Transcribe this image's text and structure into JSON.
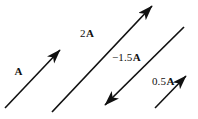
{
  "figure": {
    "background_color": "#ffffff",
    "stroke_color": "#111111",
    "width": 198,
    "height": 119
  },
  "vectors": [
    {
      "id": "a",
      "label_coefficient": "",
      "label_symbol": "A",
      "scalar": 1,
      "direction": "up-right",
      "x1": 5,
      "y1": 108,
      "x2": 60,
      "y2": 50,
      "stroke_width": 1.6,
      "head_size": 8
    },
    {
      "id": "2a",
      "label_coefficient": "2",
      "label_symbol": "A",
      "scalar": 2,
      "direction": "up-right",
      "x1": 52,
      "y1": 112,
      "x2": 152,
      "y2": 6,
      "stroke_width": 1.7,
      "head_size": 9
    },
    {
      "id": "neg15a",
      "label_coefficient": "−1.5",
      "label_symbol": "A",
      "scalar": -1.5,
      "direction": "down-left",
      "x1": 184,
      "y1": 27,
      "x2": 105,
      "y2": 105,
      "stroke_width": 1.7,
      "head_size": 9
    },
    {
      "id": "05a",
      "label_coefficient": "0.5",
      "label_symbol": "A",
      "scalar": 0.5,
      "direction": "up-right",
      "x1": 155,
      "y1": 108,
      "x2": 186,
      "y2": 76,
      "stroke_width": 1.6,
      "head_size": 8
    }
  ],
  "labels": {
    "a": {
      "coef": "",
      "sym": "A"
    },
    "two_a": {
      "coef": "2",
      "sym": "A"
    },
    "neg_15a": {
      "coef": "−1.5",
      "sym": "A"
    },
    "half_a": {
      "coef": "0.5",
      "sym": "A"
    }
  }
}
